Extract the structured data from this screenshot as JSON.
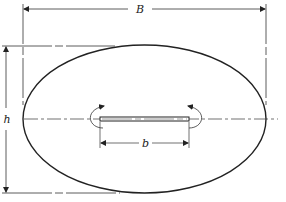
{
  "diagram": {
    "labels": {
      "width_overall": "B",
      "height_overall": "h",
      "slit_width": "b"
    },
    "colors": {
      "stroke": "#222222",
      "background": "#ffffff"
    }
  }
}
